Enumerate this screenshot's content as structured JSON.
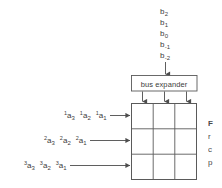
{
  "figure": {
    "name": "bus-expander-systolic-array-diagram",
    "background_color": "#ffffff",
    "line_color": "#5a5a5a",
    "text_color": "#3d3d3d"
  },
  "bus_inputs": {
    "label": "b-bus input lines",
    "items": [
      {
        "base": "b",
        "index": "2"
      },
      {
        "base": "b",
        "index": "1"
      },
      {
        "base": "b",
        "index": "0"
      },
      {
        "base": "b",
        "index": "-1"
      },
      {
        "base": "b",
        "index": "-2"
      }
    ]
  },
  "bus_expander": {
    "label": "bus expander",
    "output_count": 3
  },
  "array": {
    "rows": 3,
    "cols": 3,
    "cell_label": ""
  },
  "operand_rows": [
    {
      "row_name": "operand-row-1",
      "items": [
        {
          "base": "a",
          "sup": "1",
          "sub": "3"
        },
        {
          "base": "a",
          "sup": "1",
          "sub": "2"
        },
        {
          "base": "a",
          "sup": "1",
          "sub": "1"
        }
      ]
    },
    {
      "row_name": "operand-row-2",
      "items": [
        {
          "base": "a",
          "sup": "2",
          "sub": "3"
        },
        {
          "base": "a",
          "sup": "2",
          "sub": "2"
        },
        {
          "base": "a",
          "sup": "2",
          "sub": "1"
        }
      ]
    },
    {
      "row_name": "operand-row-3",
      "items": [
        {
          "base": "a",
          "sup": "3",
          "sub": "3"
        },
        {
          "base": "a",
          "sup": "3",
          "sub": "2"
        },
        {
          "base": "a",
          "sup": "3",
          "sub": "1"
        }
      ]
    }
  ],
  "caption": {
    "clipped": true,
    "lines": [
      "F",
      "r",
      "c",
      "p"
    ]
  }
}
